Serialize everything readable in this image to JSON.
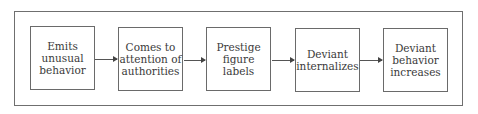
{
  "diagram": {
    "type": "flowchart",
    "direction": "left-to-right",
    "nodes": [
      {
        "id": "n1",
        "label": "Emits\nunusual\nbehavior"
      },
      {
        "id": "n2",
        "label": "Comes to\nattention of\nauthorities"
      },
      {
        "id": "n3",
        "label": "Prestige\nfigure\nlabels"
      },
      {
        "id": "n4",
        "label": "Deviant\ninternalizes"
      },
      {
        "id": "n5",
        "label": "Deviant\nbehavior\nincreases"
      }
    ],
    "edges": [
      {
        "from": "n1",
        "to": "n2"
      },
      {
        "from": "n2",
        "to": "n3"
      },
      {
        "from": "n3",
        "to": "n4"
      },
      {
        "from": "n4",
        "to": "n5"
      }
    ]
  }
}
